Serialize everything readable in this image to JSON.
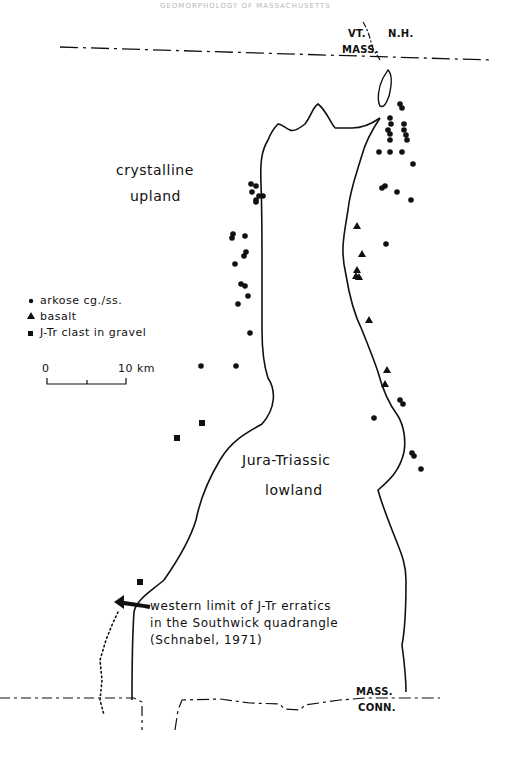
{
  "header": {
    "text": "GEOMORPHOLOGY OF MASSACHUSETTS"
  },
  "states": {
    "vt": "VT.",
    "nh": "N.H.",
    "mass_top": "MASS.",
    "mass_bottom": "MASS.",
    "conn": "CONN."
  },
  "regions": {
    "crystalline_line1": "crystalline",
    "crystalline_line2": "upland",
    "lowland_line1": "Jura-Triassic",
    "lowland_line2": "lowland"
  },
  "legend": {
    "items": [
      {
        "symbol": "circle",
        "label": "arkose cg./ss."
      },
      {
        "symbol": "triangle",
        "label": "basalt"
      },
      {
        "symbol": "square",
        "label": "J-Tr clast in gravel"
      }
    ],
    "scale": {
      "start": "0",
      "end": "10 km"
    }
  },
  "annotation": {
    "line1": "western limit of J-Tr erratics",
    "line2": "in the Southwick quadrangle",
    "line3": "(Schnabel, 1971)"
  },
  "colors": {
    "ink": "#111111",
    "background": "#ffffff"
  }
}
